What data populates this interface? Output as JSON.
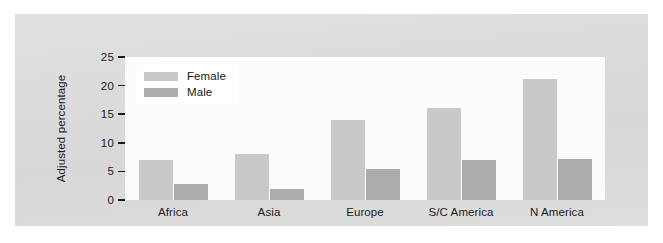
{
  "chart_data": {
    "type": "bar",
    "title": "",
    "subtitle": "",
    "xlabel": "",
    "ylabel": "Adjusted percentage",
    "ylim": [
      0,
      25
    ],
    "yticks": [
      0,
      5,
      10,
      15,
      20,
      25
    ],
    "ytick_labels": [
      "0",
      "5",
      "10",
      "15",
      "20",
      "25"
    ],
    "grid": false,
    "legend_position": "top-left-inside",
    "categories": [
      "Africa",
      "Asia",
      "Europe",
      "S/C America",
      "N America"
    ],
    "series": [
      {
        "name": "Female",
        "color": "#c9c9c9",
        "values": [
          7.0,
          8.0,
          14.0,
          16.0,
          21.2
        ]
      },
      {
        "name": "Male",
        "color": "#abacab",
        "values": [
          2.8,
          2.0,
          5.5,
          7.0,
          7.2
        ]
      }
    ]
  },
  "colors": {
    "page_background": "#ffffff",
    "panel_background": "#dcdcdc",
    "plot_background": "#fcfcfc",
    "axis_text": "#1b1b1b",
    "female_bar": "#c9c9c9",
    "male_bar": "#abacab",
    "legend_background": "#ffffff"
  }
}
